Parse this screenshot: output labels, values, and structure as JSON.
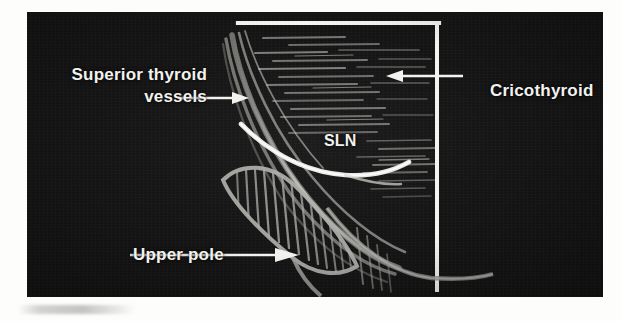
{
  "figure": {
    "kind": "anatomical-illustration",
    "panel": {
      "background_color": "#141414",
      "ink_color": "#f2f2ef",
      "structure_color": "#9a9a96"
    }
  },
  "labels": {
    "superior_thyroid_vessels": "Superior thyroid\nvessels",
    "cricothyroid": "Cricothyroid",
    "sln": "SLN",
    "upper_pole": "Upper pole"
  },
  "structures": [
    {
      "name": "superior-thyroid-vessels",
      "description": "bundle of parallel curved vessel lines descending from upper left",
      "render": "vessel-bundle"
    },
    {
      "name": "cricothyroid-muscle",
      "description": "horizontally hatched muscle belly bounded above by a white line and at right by a white vertical line",
      "render": "horizontal-hatching"
    },
    {
      "name": "superior-laryngeal-nerve",
      "description": "bright curved nerve sweeping from upper left down across the muscle",
      "render": "bright-curve"
    },
    {
      "name": "thyroid-upper-pole",
      "description": "elongated oval gland pole with dense vertical hatching",
      "render": "hatched-oval"
    }
  ],
  "leaders": [
    {
      "name": "leader-superior-thyroid-vessels",
      "direction": "right"
    },
    {
      "name": "leader-cricothyroid",
      "direction": "left"
    },
    {
      "name": "leader-upper-pole",
      "direction": "right"
    }
  ]
}
